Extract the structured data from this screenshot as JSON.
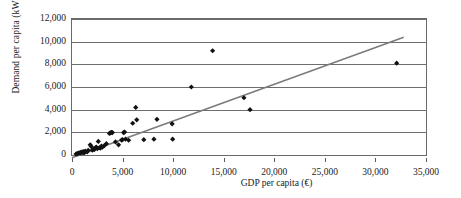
{
  "chart_data": {
    "type": "scatter",
    "title": "",
    "xlabel": "GDP per capita (€)",
    "ylabel": "Demand per capita (kWh)",
    "xlim": [
      0,
      35000
    ],
    "ylim": [
      0,
      12000
    ],
    "xticks": [
      0,
      5000,
      10000,
      15000,
      20000,
      25000,
      30000,
      35000
    ],
    "xtick_labels": [
      "0",
      "5,000",
      "10,000",
      "15,000",
      "20,000",
      "25,000",
      "30,000",
      "35,000"
    ],
    "yticks": [
      0,
      2000,
      4000,
      6000,
      8000,
      10000,
      12000
    ],
    "ytick_labels": [
      "0",
      "2,000",
      "4,000",
      "6,000",
      "8,000",
      "10,000",
      "12,000"
    ],
    "grid": "horizontal",
    "legend": null,
    "marker": {
      "shape": "diamond",
      "color": "#111111",
      "size": 4
    },
    "series": [
      {
        "name": "Countries",
        "points": [
          [
            400,
            90
          ],
          [
            500,
            120
          ],
          [
            600,
            150
          ],
          [
            700,
            200
          ],
          [
            800,
            170
          ],
          [
            900,
            260
          ],
          [
            1000,
            220
          ],
          [
            1100,
            300
          ],
          [
            1200,
            180
          ],
          [
            1300,
            340
          ],
          [
            1500,
            280
          ],
          [
            1600,
            420
          ],
          [
            1800,
            900
          ],
          [
            1900,
            760
          ],
          [
            2000,
            430
          ],
          [
            2100,
            520
          ],
          [
            2200,
            480
          ],
          [
            2300,
            620
          ],
          [
            2400,
            700
          ],
          [
            2500,
            560
          ],
          [
            2600,
            1200
          ],
          [
            2700,
            640
          ],
          [
            2800,
            600
          ],
          [
            2900,
            780
          ],
          [
            3000,
            690
          ],
          [
            3200,
            830
          ],
          [
            3400,
            1000
          ],
          [
            3700,
            1900
          ],
          [
            3800,
            1950
          ],
          [
            3900,
            2000
          ],
          [
            4000,
            1980
          ],
          [
            4300,
            1150
          ],
          [
            4600,
            900
          ],
          [
            4900,
            1320
          ],
          [
            5000,
            1350
          ],
          [
            5100,
            1980
          ],
          [
            5200,
            2020
          ],
          [
            5300,
            1400
          ],
          [
            5600,
            1300
          ],
          [
            6000,
            2800
          ],
          [
            6300,
            4200
          ],
          [
            6400,
            3100
          ],
          [
            7100,
            1350
          ],
          [
            8100,
            1400
          ],
          [
            8400,
            3150
          ],
          [
            9900,
            2750
          ],
          [
            9950,
            1400
          ],
          [
            11800,
            6000
          ],
          [
            13900,
            9200
          ],
          [
            17000,
            5050
          ],
          [
            17600,
            4000
          ],
          [
            32100,
            8100
          ]
        ]
      }
    ],
    "trendline": {
      "type": "linear",
      "color": "#7b7b7b",
      "x_start": 0,
      "y_start": -250,
      "x_end": 32800,
      "y_end": 10400
    }
  }
}
